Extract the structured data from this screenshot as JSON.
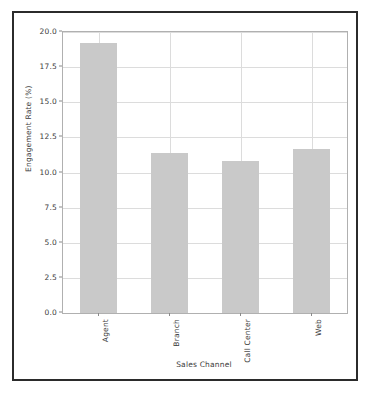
{
  "figure": {
    "background_color": "#ffffff",
    "frame_color": "#2b2b2b",
    "axes_border_color": "#b0b0b0",
    "grid_color": "#dcdcdc"
  },
  "chart_data": {
    "type": "bar",
    "title": "",
    "subtitle": "",
    "xlabel": "Sales Channel",
    "ylabel": "Engagement Rate (%)",
    "categories": [
      "Agent",
      "Branch",
      "Call Center",
      "Web"
    ],
    "values": [
      19.2,
      11.4,
      10.8,
      11.7
    ],
    "series": [
      {
        "name": "Engagement Rate",
        "values": [
          19.2,
          11.4,
          10.8,
          11.7
        ],
        "color": "#c9c9c9"
      }
    ],
    "ylim": [
      0.0,
      20.0
    ],
    "yticks": [
      0.0,
      2.5,
      5.0,
      7.5,
      10.0,
      12.5,
      15.0,
      17.5,
      20.0
    ],
    "ytick_labels": [
      "0.0",
      "2.5",
      "5.0",
      "7.5",
      "10.0",
      "12.5",
      "15.0",
      "17.5",
      "20.0"
    ],
    "xtick_labels": [
      "Agent",
      "Branch",
      "Call Center",
      "Web"
    ],
    "xtick_rotation": 90,
    "grid": true,
    "grid_axis": "both",
    "legend": false,
    "legend_position": "none",
    "bar_color": "#c9c9c9",
    "annotations": []
  }
}
